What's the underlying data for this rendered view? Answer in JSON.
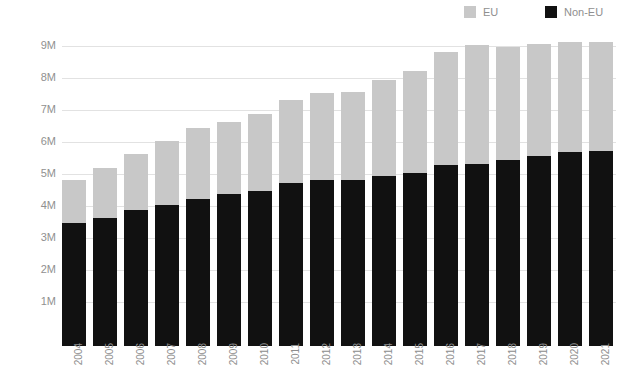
{
  "chart_data": {
    "type": "bar",
    "stacked": true,
    "title": "",
    "subtitle": "",
    "xlabel": "",
    "ylabel": "",
    "grid": true,
    "legend_position": "top-right",
    "ylim": [
      0,
      9.8
    ],
    "y_unit": "M",
    "yticks": [
      "1M",
      "2M",
      "3M",
      "4M",
      "5M",
      "6M",
      "7M",
      "8M",
      "9M"
    ],
    "ytick_values": [
      1,
      2,
      3,
      4,
      5,
      6,
      7,
      8,
      9
    ],
    "categories": [
      "2004",
      "2005",
      "2006",
      "2007",
      "2008",
      "2009",
      "2010",
      "2011",
      "2012",
      "2013",
      "2014",
      "2015",
      "2016",
      "2017",
      "2018",
      "2019",
      "2020",
      "2021"
    ],
    "series": [
      {
        "name": "Non-EU",
        "color": "#111111",
        "values": [
          3.85,
          4.0,
          4.25,
          4.4,
          4.6,
          4.75,
          4.85,
          5.1,
          5.2,
          5.2,
          5.3,
          5.4,
          5.65,
          5.7,
          5.8,
          5.95,
          6.05,
          6.1
        ]
      },
      {
        "name": "EU",
        "color": "#c8c8c8",
        "values": [
          1.35,
          1.55,
          1.75,
          2.0,
          2.2,
          2.25,
          2.4,
          2.6,
          2.7,
          2.75,
          3.0,
          3.2,
          3.55,
          3.7,
          3.55,
          3.5,
          3.45,
          3.4
        ]
      }
    ],
    "totals": [
      5.2,
      5.55,
      6.0,
      6.4,
      6.8,
      7.0,
      7.25,
      7.7,
      7.9,
      7.95,
      8.3,
      8.6,
      9.2,
      9.4,
      9.35,
      9.45,
      9.5,
      9.5
    ]
  },
  "legend": {
    "items": [
      {
        "label": "EU",
        "color": "#c8c8c8"
      },
      {
        "label": "Non-EU",
        "color": "#111111"
      }
    ]
  },
  "colors": {
    "eu": "#c8c8c8",
    "non_eu": "#111111",
    "gridline": "#e2e2e2",
    "axis_text": "#8d8d8d",
    "background": "#ffffff"
  }
}
